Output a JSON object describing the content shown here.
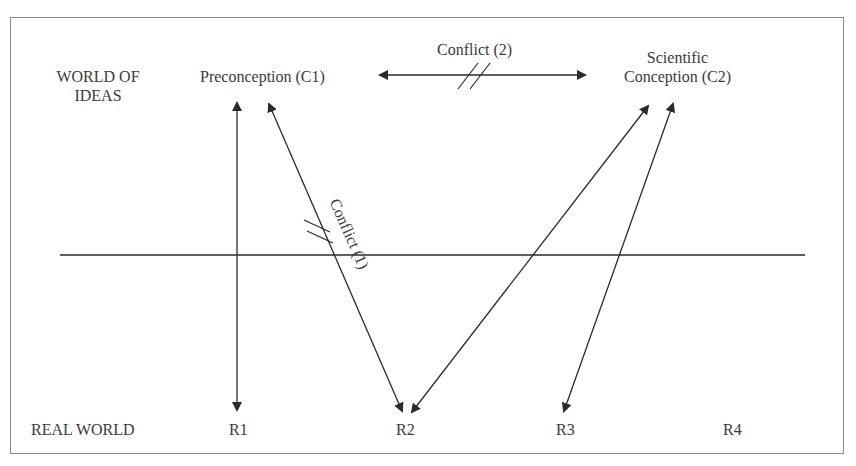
{
  "diagram": {
    "levels": {
      "ideas_line1": "WORLD OF",
      "ideas_line2": "IDEAS",
      "real": "REAL WORLD"
    },
    "concepts": {
      "c1": "Preconception (C1)",
      "c2_line1": "Scientific",
      "c2_line2": "Conception (C2)"
    },
    "conflicts": {
      "conflict1": "Conflict (1)",
      "conflict2": "Conflict (2)"
    },
    "real_items": [
      "R1",
      "R2",
      "R3",
      "R4"
    ],
    "colors": {
      "line": "#2a2a2a",
      "frame": "#8a8a8a",
      "text": "#3a3a3a"
    }
  }
}
